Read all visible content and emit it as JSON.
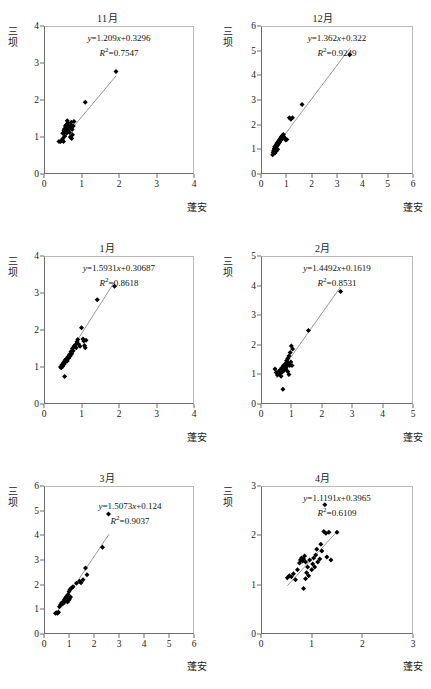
{
  "figure": {
    "axis_labels": {
      "y": [
        "三",
        "坝"
      ],
      "x": "蓬安"
    }
  },
  "chart_data": [
    {
      "type": "scatter",
      "title": "11月",
      "xlabel": "蓬安",
      "ylabel": "三坝",
      "xlim": [
        0,
        4
      ],
      "ylim": [
        0,
        4
      ],
      "xticks": [
        0,
        1,
        2,
        3,
        4
      ],
      "yticks": [
        0,
        1,
        2,
        3,
        4
      ],
      "grid": false,
      "equation": "y=1.209x+0.3296",
      "slope": 1.209,
      "intercept": 0.3296,
      "r2_label": "R2=0.7547",
      "r2": 0.7547,
      "fit_line": {
        "x0": 0.42,
        "x1": 1.92
      },
      "points": [
        [
          0.4,
          0.88
        ],
        [
          0.44,
          0.88
        ],
        [
          0.47,
          0.9
        ],
        [
          0.52,
          0.88
        ],
        [
          0.55,
          1.02
        ],
        [
          0.5,
          1.1
        ],
        [
          0.53,
          1.18
        ],
        [
          0.57,
          1.14
        ],
        [
          0.58,
          1.22
        ],
        [
          0.6,
          1.1
        ],
        [
          0.62,
          1.18
        ],
        [
          0.63,
          1.26
        ],
        [
          0.65,
          1.3
        ],
        [
          0.6,
          1.34
        ],
        [
          0.57,
          1.3
        ],
        [
          0.64,
          1.38
        ],
        [
          0.66,
          1.2
        ],
        [
          0.68,
          1.12
        ],
        [
          0.7,
          1.24
        ],
        [
          0.72,
          1.32
        ],
        [
          0.73,
          1.4
        ],
        [
          0.7,
          1.0
        ],
        [
          0.74,
          0.96
        ],
        [
          0.76,
          1.06
        ],
        [
          0.78,
          1.3
        ],
        [
          0.75,
          1.2
        ],
        [
          0.8,
          1.42
        ],
        [
          0.62,
          1.44
        ],
        [
          0.55,
          1.22
        ],
        [
          0.5,
          0.95
        ],
        [
          1.1,
          1.94
        ],
        [
          1.92,
          2.77
        ]
      ]
    },
    {
      "type": "scatter",
      "title": "12月",
      "xlabel": "蓬安",
      "ylabel": "三坝",
      "xlim": [
        0,
        6
      ],
      "ylim": [
        0,
        6
      ],
      "xticks": [
        0,
        1,
        2,
        3,
        4,
        5,
        6
      ],
      "yticks": [
        0,
        1,
        2,
        3,
        4,
        5,
        6
      ],
      "grid": false,
      "equation": "y=1.362x+0.322",
      "slope": 1.362,
      "intercept": 0.322,
      "r2_label": "R2=0.9249",
      "r2": 0.9249,
      "fit_line": {
        "x0": 0.45,
        "x1": 3.5
      },
      "points": [
        [
          0.46,
          0.78
        ],
        [
          0.48,
          0.88
        ],
        [
          0.5,
          0.95
        ],
        [
          0.52,
          1.02
        ],
        [
          0.54,
          1.1
        ],
        [
          0.56,
          1.05
        ],
        [
          0.58,
          1.14
        ],
        [
          0.6,
          1.2
        ],
        [
          0.62,
          1.12
        ],
        [
          0.64,
          1.26
        ],
        [
          0.66,
          1.18
        ],
        [
          0.68,
          1.32
        ],
        [
          0.7,
          1.24
        ],
        [
          0.72,
          1.38
        ],
        [
          0.74,
          1.3
        ],
        [
          0.76,
          1.44
        ],
        [
          0.78,
          1.36
        ],
        [
          0.8,
          1.5
        ],
        [
          0.82,
          1.42
        ],
        [
          0.84,
          1.56
        ],
        [
          0.86,
          1.48
        ],
        [
          0.88,
          1.6
        ],
        [
          0.9,
          1.52
        ],
        [
          0.94,
          1.44
        ],
        [
          0.98,
          1.38
        ],
        [
          1.02,
          1.4
        ],
        [
          1.12,
          2.28
        ],
        [
          1.18,
          2.22
        ],
        [
          1.24,
          2.28
        ],
        [
          1.62,
          2.82
        ],
        [
          3.5,
          4.83
        ],
        [
          0.55,
          0.85
        ],
        [
          0.6,
          0.92
        ],
        [
          0.66,
          1.0
        ]
      ]
    },
    {
      "type": "scatter",
      "title": "1月",
      "xlabel": "蓬安",
      "ylabel": "三坝",
      "xlim": [
        0,
        4
      ],
      "ylim": [
        0,
        4
      ],
      "xticks": [
        0,
        1,
        2,
        3,
        4
      ],
      "yticks": [
        0,
        1,
        2,
        3,
        4
      ],
      "grid": false,
      "equation": "y=1.5931x+0.30687",
      "slope": 1.5931,
      "intercept": 0.30687,
      "r2_label": "R2=0.8618",
      "r2": 0.8618,
      "fit_line": {
        "x0": 0.44,
        "x1": 1.88
      },
      "points": [
        [
          0.44,
          1.0
        ],
        [
          0.46,
          0.98
        ],
        [
          0.48,
          1.06
        ],
        [
          0.5,
          1.02
        ],
        [
          0.52,
          1.12
        ],
        [
          0.54,
          1.08
        ],
        [
          0.55,
          0.74
        ],
        [
          0.56,
          1.18
        ],
        [
          0.58,
          1.14
        ],
        [
          0.6,
          1.22
        ],
        [
          0.62,
          1.16
        ],
        [
          0.64,
          1.28
        ],
        [
          0.66,
          1.24
        ],
        [
          0.68,
          1.34
        ],
        [
          0.7,
          1.3
        ],
        [
          0.72,
          1.42
        ],
        [
          0.74,
          1.36
        ],
        [
          0.76,
          1.5
        ],
        [
          0.78,
          1.44
        ],
        [
          0.8,
          1.56
        ],
        [
          0.84,
          1.6
        ],
        [
          0.86,
          1.52
        ],
        [
          0.88,
          1.68
        ],
        [
          0.9,
          1.74
        ],
        [
          0.92,
          1.62
        ],
        [
          0.96,
          1.56
        ],
        [
          1.0,
          2.06
        ],
        [
          1.04,
          1.76
        ],
        [
          1.06,
          1.7
        ],
        [
          1.08,
          1.58
        ],
        [
          1.1,
          1.52
        ],
        [
          1.12,
          1.72
        ],
        [
          1.42,
          2.82
        ],
        [
          1.88,
          3.18
        ]
      ]
    },
    {
      "type": "scatter",
      "title": "2月",
      "xlabel": "蓬安",
      "ylabel": "三坝",
      "xlim": [
        0,
        5
      ],
      "ylim": [
        0,
        5
      ],
      "xticks": [
        0,
        1,
        2,
        3,
        4,
        5
      ],
      "yticks": [
        0,
        1,
        2,
        3,
        4,
        5
      ],
      "grid": false,
      "equation": "y=1.4492x+0.1619",
      "slope": 1.4492,
      "intercept": 0.1619,
      "r2_label": "R2=0.8531",
      "r2": 0.8531,
      "fit_line": {
        "x0": 0.5,
        "x1": 2.62
      },
      "points": [
        [
          0.46,
          1.18
        ],
        [
          0.5,
          1.06
        ],
        [
          0.54,
          0.98
        ],
        [
          0.58,
          1.1
        ],
        [
          0.62,
          1.02
        ],
        [
          0.64,
          1.16
        ],
        [
          0.66,
          0.94
        ],
        [
          0.68,
          1.22
        ],
        [
          0.7,
          1.08
        ],
        [
          0.72,
          0.5
        ],
        [
          0.74,
          1.3
        ],
        [
          0.76,
          1.14
        ],
        [
          0.78,
          1.24
        ],
        [
          0.8,
          1.36
        ],
        [
          0.82,
          1.18
        ],
        [
          0.84,
          1.46
        ],
        [
          0.86,
          1.28
        ],
        [
          0.88,
          1.54
        ],
        [
          0.9,
          1.38
        ],
        [
          0.92,
          1.62
        ],
        [
          0.94,
          1.3
        ],
        [
          0.96,
          1.74
        ],
        [
          0.98,
          1.42
        ],
        [
          1.0,
          1.96
        ],
        [
          1.02,
          1.3
        ],
        [
          1.04,
          1.86
        ],
        [
          0.88,
          1.1
        ],
        [
          0.92,
          1.0
        ],
        [
          1.56,
          2.48
        ],
        [
          2.62,
          3.8
        ]
      ]
    },
    {
      "type": "scatter",
      "title": "3月",
      "xlabel": "蓬安",
      "ylabel": "三坝",
      "xlim": [
        0,
        6
      ],
      "ylim": [
        0,
        6
      ],
      "xticks": [
        0,
        1,
        2,
        3,
        4,
        5,
        6
      ],
      "yticks": [
        0,
        1,
        2,
        3,
        4,
        5,
        6
      ],
      "grid": false,
      "equation": "y=1.5073x+0.124",
      "slope": 1.5073,
      "intercept": 0.124,
      "r2_label": "R2=0.9037",
      "r2": 0.9037,
      "fit_line": {
        "x0": 0.5,
        "x1": 2.6
      },
      "points": [
        [
          0.46,
          0.84
        ],
        [
          0.5,
          0.86
        ],
        [
          0.54,
          0.84
        ],
        [
          0.58,
          0.88
        ],
        [
          0.62,
          1.1
        ],
        [
          0.66,
          1.18
        ],
        [
          0.7,
          1.26
        ],
        [
          0.74,
          1.22
        ],
        [
          0.78,
          1.32
        ],
        [
          0.8,
          1.28
        ],
        [
          0.82,
          1.4
        ],
        [
          0.84,
          1.34
        ],
        [
          0.86,
          1.46
        ],
        [
          0.88,
          1.38
        ],
        [
          0.9,
          1.52
        ],
        [
          0.92,
          1.44
        ],
        [
          0.94,
          1.3
        ],
        [
          0.96,
          1.6
        ],
        [
          0.98,
          1.36
        ],
        [
          1.0,
          1.72
        ],
        [
          1.02,
          1.42
        ],
        [
          1.04,
          1.8
        ],
        [
          1.06,
          1.5
        ],
        [
          1.1,
          1.86
        ],
        [
          1.16,
          1.92
        ],
        [
          1.3,
          2.06
        ],
        [
          1.42,
          2.14
        ],
        [
          1.48,
          2.08
        ],
        [
          1.56,
          2.2
        ],
        [
          1.66,
          2.68
        ],
        [
          1.72,
          2.4
        ],
        [
          2.34,
          3.52
        ],
        [
          2.58,
          4.86
        ]
      ]
    },
    {
      "type": "scatter",
      "title": "4月",
      "xlabel": "蓬安",
      "ylabel": "三坝",
      "xlim": [
        0,
        3
      ],
      "ylim": [
        0,
        3
      ],
      "xticks": [
        0,
        1,
        2,
        3
      ],
      "yticks": [
        0,
        1,
        2,
        3
      ],
      "grid": false,
      "equation": "y=1.1191x+0.3965",
      "slope": 1.1191,
      "intercept": 0.3965,
      "r2_label": "R2=0.6109",
      "r2": 0.6109,
      "fit_line": {
        "x0": 0.52,
        "x1": 1.5
      },
      "points": [
        [
          0.52,
          1.14
        ],
        [
          0.56,
          1.18
        ],
        [
          0.6,
          1.16
        ],
        [
          0.64,
          1.22
        ],
        [
          0.68,
          1.1
        ],
        [
          0.72,
          1.3
        ],
        [
          0.76,
          1.44
        ],
        [
          0.78,
          1.5
        ],
        [
          0.8,
          1.54
        ],
        [
          0.82,
          1.48
        ],
        [
          0.84,
          1.52
        ],
        [
          0.84,
          0.92
        ],
        [
          0.86,
          1.58
        ],
        [
          0.88,
          1.46
        ],
        [
          0.88,
          1.12
        ],
        [
          0.9,
          1.24
        ],
        [
          0.92,
          1.36
        ],
        [
          0.94,
          1.18
        ],
        [
          0.96,
          1.5
        ],
        [
          1.0,
          1.3
        ],
        [
          1.02,
          1.42
        ],
        [
          1.04,
          1.54
        ],
        [
          1.06,
          1.36
        ],
        [
          1.08,
          1.6
        ],
        [
          1.1,
          1.72
        ],
        [
          1.12,
          1.46
        ],
        [
          1.16,
          1.52
        ],
        [
          1.18,
          1.82
        ],
        [
          1.2,
          1.68
        ],
        [
          1.24,
          2.08
        ],
        [
          1.26,
          2.62
        ],
        [
          1.28,
          2.04
        ],
        [
          1.3,
          1.56
        ],
        [
          1.34,
          2.06
        ],
        [
          1.38,
          1.5
        ],
        [
          1.5,
          2.06
        ]
      ]
    }
  ]
}
